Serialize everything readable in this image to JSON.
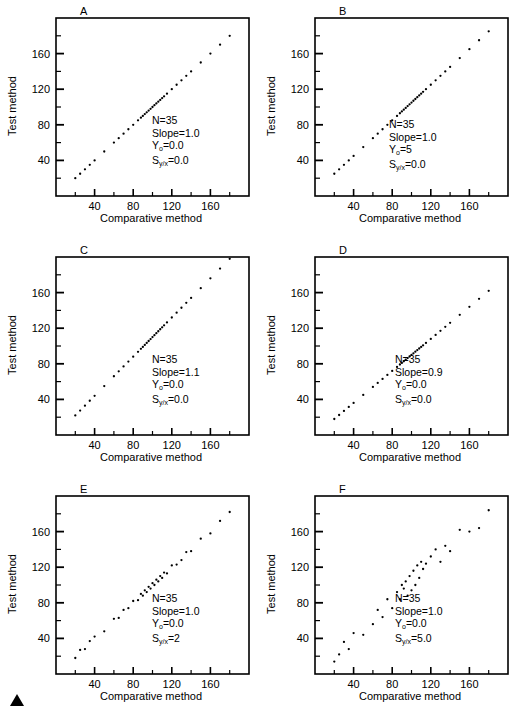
{
  "figure": {
    "marker": "filled-triangle"
  },
  "axes": {
    "xlabel": "Comparative method",
    "ylabel": "Test method",
    "xticks": [
      "40",
      "80",
      "120",
      "160"
    ],
    "yticks": [
      "40",
      "80",
      "120",
      "160"
    ],
    "xlim": [
      0,
      200
    ],
    "ylim": [
      0,
      200
    ],
    "xtick_values": [
      40,
      80,
      120,
      160
    ],
    "ytick_values": [
      40,
      80,
      120,
      160
    ],
    "minor_xtick_values": [
      20,
      60,
      100,
      140,
      180
    ],
    "minor_ytick_values": [
      20,
      60,
      100,
      140,
      180
    ]
  },
  "labels": {
    "n": "N",
    "slope": "Slope",
    "intercept": "Y",
    "intercept_sub": "o",
    "syx": "S",
    "syx_sub": "y/x",
    "eq": "="
  },
  "chart_data": [
    {
      "type": "scatter",
      "panel": "A",
      "title": "A",
      "xlabel": "Comparative method",
      "ylabel": "Test method",
      "xlim": [
        0,
        200
      ],
      "ylim": [
        0,
        200
      ],
      "grid": false,
      "n": 35,
      "slope": 1.0,
      "intercept": 0.0,
      "syx": 0.0,
      "stats_text": [
        "N=35",
        "Slope=1.0",
        "Yo=0.0",
        "Sy/x=0.0"
      ],
      "x": [
        20,
        25,
        30,
        35,
        40,
        50,
        60,
        65,
        70,
        75,
        80,
        85,
        88,
        90,
        92,
        94,
        96,
        98,
        100,
        102,
        104,
        106,
        108,
        110,
        112,
        115,
        120,
        125,
        130,
        135,
        140,
        150,
        160,
        170,
        180
      ],
      "y": [
        20,
        25,
        30,
        35,
        40,
        50,
        60,
        65,
        70,
        75,
        80,
        85,
        88,
        90,
        92,
        94,
        96,
        98,
        100,
        102,
        104,
        106,
        108,
        110,
        112,
        115,
        120,
        125,
        130,
        135,
        140,
        150,
        160,
        170,
        180
      ]
    },
    {
      "type": "scatter",
      "panel": "B",
      "title": "B",
      "xlabel": "Comparative method",
      "ylabel": "Test method",
      "xlim": [
        0,
        200
      ],
      "ylim": [
        0,
        200
      ],
      "grid": false,
      "n": 35,
      "slope": 1.0,
      "intercept": 5,
      "syx": 0.0,
      "stats_text": [
        "N=35",
        "Slope=1.0",
        "Yo=5",
        "Sy/x=0.0"
      ],
      "x": [
        20,
        25,
        30,
        35,
        40,
        50,
        60,
        65,
        70,
        75,
        80,
        85,
        88,
        90,
        92,
        94,
        96,
        98,
        100,
        102,
        104,
        106,
        108,
        110,
        112,
        115,
        120,
        125,
        130,
        135,
        140,
        150,
        160,
        170,
        180
      ],
      "y": [
        25,
        30,
        35,
        40,
        45,
        55,
        65,
        70,
        75,
        80,
        85,
        90,
        93,
        95,
        97,
        99,
        101,
        103,
        105,
        107,
        109,
        111,
        113,
        115,
        117,
        120,
        125,
        130,
        135,
        140,
        145,
        155,
        165,
        175,
        185
      ]
    },
    {
      "type": "scatter",
      "panel": "C",
      "title": "C",
      "xlabel": "Comparative method",
      "ylabel": "Test method",
      "xlim": [
        0,
        200
      ],
      "ylim": [
        0,
        200
      ],
      "grid": false,
      "n": 35,
      "slope": 1.1,
      "intercept": 0.0,
      "syx": 0.0,
      "stats_text": [
        "N=35",
        "Slope=1.1",
        "Yo=0.0",
        "Sy/x=0.0"
      ],
      "x": [
        20,
        25,
        30,
        35,
        40,
        50,
        60,
        65,
        70,
        75,
        80,
        85,
        88,
        90,
        92,
        94,
        96,
        98,
        100,
        102,
        104,
        106,
        108,
        110,
        112,
        115,
        120,
        125,
        130,
        135,
        140,
        150,
        160,
        170,
        180
      ],
      "y": [
        22,
        27.5,
        33,
        38.5,
        44,
        55,
        66,
        71.5,
        77,
        82.5,
        88,
        93.5,
        96.8,
        99,
        101.2,
        103.4,
        105.6,
        107.8,
        110,
        112.2,
        114.4,
        116.6,
        118.8,
        121,
        123.2,
        126.5,
        132,
        137.5,
        143,
        148.5,
        154,
        165,
        176,
        187,
        198
      ]
    },
    {
      "type": "scatter",
      "panel": "D",
      "title": "D",
      "xlabel": "Comparative method",
      "ylabel": "Test method",
      "xlim": [
        0,
        200
      ],
      "ylim": [
        0,
        200
      ],
      "grid": false,
      "n": 35,
      "slope": 0.9,
      "intercept": 0.0,
      "syx": 0.0,
      "stats_text": [
        "N=35",
        "Slope=0.9",
        "Yo=0.0",
        "Sy/x=0.0"
      ],
      "x": [
        20,
        25,
        30,
        35,
        40,
        50,
        60,
        65,
        70,
        75,
        80,
        85,
        88,
        90,
        92,
        94,
        96,
        98,
        100,
        102,
        104,
        106,
        108,
        110,
        112,
        115,
        120,
        125,
        130,
        135,
        140,
        150,
        160,
        170,
        180
      ],
      "y": [
        18,
        22.5,
        27,
        31.5,
        36,
        45,
        54,
        58.5,
        63,
        67.5,
        72,
        76.5,
        79.2,
        81,
        82.8,
        84.6,
        86.4,
        88.2,
        90,
        91.8,
        93.6,
        95.4,
        97.2,
        99,
        100.8,
        103.5,
        108,
        112.5,
        117,
        121.5,
        126,
        135,
        144,
        153,
        162
      ]
    },
    {
      "type": "scatter",
      "panel": "E",
      "title": "E",
      "xlabel": "Comparative method",
      "ylabel": "Test method",
      "xlim": [
        0,
        200
      ],
      "ylim": [
        0,
        200
      ],
      "grid": false,
      "n": 35,
      "slope": 1.0,
      "intercept": 0.0,
      "syx": 2,
      "stats_text": [
        "N=35",
        "Slope=1.0",
        "Yo=0.0",
        "Sy/x=2"
      ],
      "x": [
        20,
        25,
        30,
        35,
        40,
        50,
        60,
        65,
        70,
        75,
        80,
        85,
        88,
        90,
        92,
        94,
        96,
        98,
        100,
        102,
        104,
        106,
        108,
        110,
        112,
        115,
        120,
        125,
        130,
        135,
        140,
        150,
        160,
        170,
        180
      ],
      "y": [
        18,
        27,
        28,
        37,
        42,
        48,
        62,
        63,
        72,
        74,
        82,
        83,
        90,
        88,
        94,
        92,
        98,
        96,
        102,
        100,
        106,
        104,
        110,
        108,
        114,
        113,
        122,
        123,
        128,
        137,
        138,
        152,
        158,
        172,
        182
      ]
    },
    {
      "type": "scatter",
      "panel": "F",
      "title": "F",
      "xlabel": "Comparative method",
      "ylabel": "Test method",
      "xlim": [
        0,
        200
      ],
      "ylim": [
        0,
        200
      ],
      "grid": false,
      "n": 35,
      "slope": 1.0,
      "intercept": 0.0,
      "syx": 5.0,
      "stats_text": [
        "N=35",
        "Slope=1.0",
        "Yo=0.0",
        "Sy/x=5.0"
      ],
      "x": [
        20,
        25,
        30,
        35,
        40,
        50,
        60,
        65,
        70,
        75,
        80,
        85,
        88,
        90,
        92,
        94,
        96,
        98,
        100,
        102,
        104,
        106,
        108,
        110,
        112,
        115,
        120,
        125,
        130,
        135,
        140,
        150,
        160,
        170,
        180
      ],
      "y": [
        14,
        22,
        36,
        28,
        46,
        44,
        56,
        72,
        64,
        84,
        74,
        92,
        84,
        100,
        96,
        104,
        88,
        110,
        94,
        116,
        100,
        122,
        108,
        126,
        118,
        124,
        132,
        140,
        126,
        144,
        138,
        162,
        160,
        164,
        184
      ]
    }
  ]
}
